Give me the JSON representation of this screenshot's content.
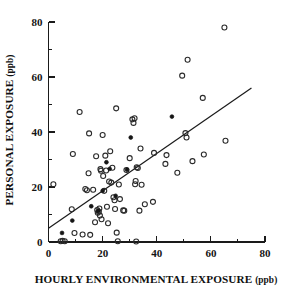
{
  "chart_data": {
    "type": "scatter",
    "title": "",
    "xlabel": "HOURLY ENVIRONMENTAL EXPOSURE",
    "xlabel_unit": "(ppb)",
    "ylabel": "PERSONAL EXPOSURE",
    "ylabel_unit": "(ppb)",
    "xlim": [
      0,
      80
    ],
    "ylim": [
      0,
      80
    ],
    "xticks": [
      0,
      20,
      40,
      60,
      80
    ],
    "yticks": [
      0,
      20,
      40,
      60,
      80
    ],
    "xticklabels": [
      "0",
      "20",
      "40",
      "60",
      "80"
    ],
    "yticklabels": [
      "0",
      "20",
      "40",
      "60",
      "80"
    ],
    "xminorticks": [
      10,
      30,
      50,
      70
    ],
    "yminorticks": [
      10,
      30,
      50,
      70
    ],
    "grid": false,
    "legend": null,
    "series": [
      {
        "name": "open-circle-samples",
        "marker": "open circle",
        "color": "#2a2a2a",
        "points": [
          [
            1.8,
            21.0
          ],
          [
            4.5,
            0.3
          ],
          [
            5.2,
            0.4
          ],
          [
            6.0,
            0.3
          ],
          [
            8.6,
            11.9
          ],
          [
            9.0,
            32.0
          ],
          [
            9.6,
            3.3
          ],
          [
            11.5,
            47.3
          ],
          [
            12.6,
            2.7
          ],
          [
            13.6,
            19.3
          ],
          [
            14.2,
            18.8
          ],
          [
            14.8,
            25.0
          ],
          [
            15.0,
            39.5
          ],
          [
            15.4,
            2.6
          ],
          [
            16.5,
            19.0
          ],
          [
            17.2,
            7.2
          ],
          [
            17.6,
            31.2
          ],
          [
            18.0,
            11.6
          ],
          [
            18.2,
            10.6
          ],
          [
            18.6,
            11.0
          ],
          [
            18.8,
            12.2
          ],
          [
            19.0,
            9.6
          ],
          [
            19.2,
            26.5
          ],
          [
            19.4,
            25.9
          ],
          [
            19.6,
            8.3
          ],
          [
            20.0,
            38.9
          ],
          [
            20.2,
            24.0
          ],
          [
            20.6,
            18.6
          ],
          [
            21.0,
            31.4
          ],
          [
            21.3,
            26.0
          ],
          [
            21.6,
            12.8
          ],
          [
            22.0,
            6.8
          ],
          [
            22.4,
            22.0
          ],
          [
            22.8,
            33.0
          ],
          [
            23.2,
            21.6
          ],
          [
            23.6,
            27.0
          ],
          [
            24.0,
            16.3
          ],
          [
            24.4,
            15.2
          ],
          [
            24.6,
            12.0
          ],
          [
            25.0,
            48.6
          ],
          [
            25.2,
            3.4
          ],
          [
            25.6,
            0.3
          ],
          [
            26.0,
            20.9
          ],
          [
            26.4,
            15.6
          ],
          [
            27.6,
            11.5
          ],
          [
            28.0,
            11.4
          ],
          [
            28.8,
            26.2
          ],
          [
            30.0,
            30.5
          ],
          [
            31.0,
            44.6
          ],
          [
            31.4,
            43.3
          ],
          [
            31.8,
            45.0
          ],
          [
            32.0,
            21.0
          ],
          [
            32.2,
            22.2
          ],
          [
            32.4,
            0.2
          ],
          [
            32.6,
            27.2
          ],
          [
            33.0,
            26.9
          ],
          [
            33.6,
            11.4
          ],
          [
            34.0,
            34.0
          ],
          [
            34.4,
            20.8
          ],
          [
            35.6,
            13.7
          ],
          [
            38.6,
            14.6
          ],
          [
            39.0,
            32.4
          ],
          [
            43.2,
            28.4
          ],
          [
            43.6,
            31.6
          ],
          [
            47.6,
            25.2
          ],
          [
            49.4,
            60.5
          ],
          [
            50.6,
            39.6
          ],
          [
            51.0,
            38.0
          ],
          [
            51.4,
            66.3
          ],
          [
            53.2,
            29.4
          ],
          [
            57.0,
            52.4
          ],
          [
            57.4,
            31.8
          ],
          [
            65.0,
            78.0
          ],
          [
            65.4,
            36.8
          ]
        ]
      },
      {
        "name": "filled-circle-samples",
        "marker": "filled circle",
        "color": "#151515",
        "points": [
          [
            5.0,
            3.3
          ],
          [
            8.8,
            7.8
          ],
          [
            15.8,
            13.0
          ],
          [
            18.4,
            11.4
          ],
          [
            20.0,
            18.6
          ],
          [
            21.4,
            29.0
          ],
          [
            22.6,
            26.6
          ],
          [
            24.8,
            16.8
          ],
          [
            29.0,
            26.3
          ],
          [
            30.4,
            38.0
          ],
          [
            45.6,
            45.6
          ]
        ]
      }
    ],
    "fit_line": {
      "name": "regression-line",
      "x_start": 0,
      "y_start": 5.0,
      "x_end": 75.0,
      "y_end": 56.0
    }
  }
}
